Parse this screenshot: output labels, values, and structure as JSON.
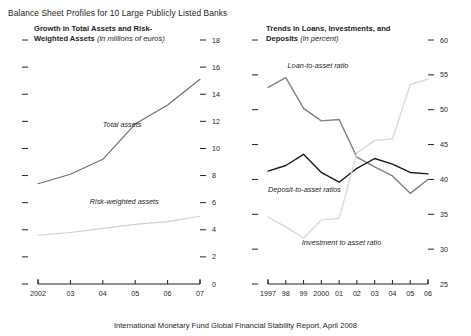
{
  "figure": {
    "title": "Balance Sheet Profiles for 10 Large Publicly Listed Banks",
    "footer": "International Monetary Fund Global Financial Stability Report, April 2008"
  },
  "panels": {
    "left": {
      "heading": "Growth in Total Assets and Risk-Weighted Assets",
      "units": "(in millions of euros)"
    },
    "right": {
      "heading": "Trends in Loans, Investments, and Deposits",
      "units": "(in percent)"
    }
  },
  "chart_data": [
    {
      "type": "line",
      "title": "Growth in Total Assets and Risk-Weighted Assets",
      "subtitle": "(in millions of euros)",
      "xlabel": "",
      "ylabel": "",
      "x": [
        2002,
        2003,
        2004,
        2005,
        2006,
        2007
      ],
      "tick_labels": [
        "2002",
        "03",
        "04",
        "05",
        "06",
        "07"
      ],
      "ylim": [
        0,
        18
      ],
      "yticks": [
        0,
        2,
        4,
        6,
        8,
        10,
        12,
        14,
        16,
        18
      ],
      "ytick_labels": [
        "0",
        "2",
        "4",
        "6",
        "8",
        "10",
        "12",
        "14",
        "16",
        "18"
      ],
      "y_axis_side": "right",
      "grid": false,
      "legend": "inline-annotations",
      "series": [
        {
          "name": "Total assets",
          "color": "#6e6e6e",
          "values": [
            7.4,
            8.1,
            9.2,
            11.8,
            13.2,
            15.1
          ]
        },
        {
          "name": "Risk-weighted assets",
          "color": "#cfcfcf",
          "values": [
            3.6,
            3.8,
            4.1,
            4.4,
            4.6,
            5.0
          ]
        }
      ],
      "annotations": [
        {
          "text": "Total assets",
          "x": 2004.0,
          "y": 11.6
        },
        {
          "text": "Risk-weighted assets",
          "x": 2003.6,
          "y": 5.9
        }
      ]
    },
    {
      "type": "line",
      "title": "Trends in Loans, Investments, and Deposits",
      "subtitle": "(in percent)",
      "xlabel": "",
      "ylabel": "",
      "x": [
        1997,
        1998,
        1999,
        2000,
        2001,
        2002,
        2003,
        2004,
        2005,
        2006
      ],
      "tick_labels": [
        "1997",
        "98",
        "99",
        "2000",
        "01",
        "02",
        "03",
        "04",
        "05",
        "06"
      ],
      "ylim": [
        25,
        60
      ],
      "yticks": [
        25,
        30,
        35,
        40,
        45,
        50,
        55,
        60
      ],
      "ytick_labels": [
        "25",
        "30",
        "35",
        "40",
        "45",
        "50",
        "55",
        "60"
      ],
      "y_axis_side": "right",
      "grid": false,
      "legend": "inline-annotations",
      "series": [
        {
          "name": "Loan-to-asset ratio",
          "color": "#808080",
          "values": [
            53.2,
            54.6,
            50.2,
            48.4,
            48.6,
            43.2,
            41.8,
            40.5,
            38.0,
            40.0
          ]
        },
        {
          "name": "Deposit-to-asset ratios",
          "color": "#1a1a1a",
          "values": [
            41.2,
            42.0,
            43.6,
            41.0,
            39.6,
            41.6,
            43.0,
            42.2,
            41.0,
            40.8
          ]
        },
        {
          "name": "Investment to asset ratio",
          "color": "#d9d9d9",
          "values": [
            34.6,
            33.2,
            31.6,
            34.2,
            34.4,
            43.8,
            45.6,
            45.8,
            53.6,
            54.4
          ]
        }
      ],
      "annotations": [
        {
          "text": "Loan-to-asset ratio",
          "x": 1998.1,
          "y": 56.0
        },
        {
          "text": "Deposit-to-asset ratios",
          "x": 1997.0,
          "y": 38.2
        },
        {
          "text": "Investment to asset ratio",
          "x": 1998.9,
          "y": 30.6
        }
      ]
    }
  ]
}
